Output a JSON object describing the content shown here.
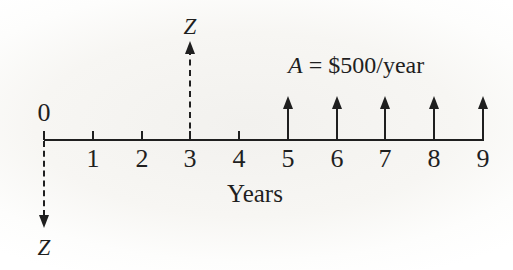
{
  "diagram": {
    "type": "cash-flow-diagram",
    "axis_label": "Years",
    "origin_label": "0",
    "year_labels": [
      "1",
      "2",
      "3",
      "4",
      "5",
      "6",
      "7",
      "8",
      "9"
    ],
    "tick_years": [
      0,
      1,
      2,
      3,
      4
    ],
    "cashflows": {
      "years": [
        5,
        6,
        7,
        8,
        9
      ],
      "amount_per_year": 500,
      "amount_label": "A = $500/year",
      "direction": "up"
    },
    "annotation": {
      "variable": "A",
      "rest": " = $500/year"
    },
    "z_up": {
      "label": "Z",
      "year": 3,
      "style": "dashed"
    },
    "z_down": {
      "label": "Z",
      "year": 0,
      "style": "dashed"
    },
    "ink_color": "#1f1f1f"
  }
}
